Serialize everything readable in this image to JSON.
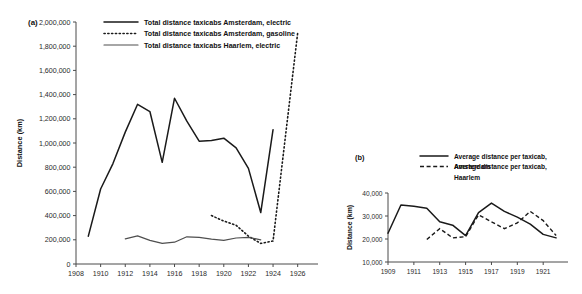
{
  "figure": {
    "background": "#ffffff",
    "ink": "#1a1a1a"
  },
  "panel_a": {
    "tag": "(a)",
    "ylabel": "Distance (km)",
    "legend": [
      {
        "label": "Total distance taxicabs Amsterdam, electric",
        "style": "solid"
      },
      {
        "label": "Total distance taxicabs Amsterdam, gasoline",
        "style": "dotted"
      },
      {
        "label": "Total distance taxicabs Haarlem, electric",
        "style": "thin-solid"
      }
    ],
    "ytick_labels": [
      "0",
      "200,000",
      "400,000",
      "600,000",
      "800,000",
      "1,000,000",
      "1,200,000",
      "1,400,000",
      "1,600,000",
      "1,800,000",
      "2,000,000"
    ],
    "xtick_labels": [
      "1908",
      "1910",
      "1912",
      "1914",
      "1916",
      "1918",
      "1920",
      "1922",
      "1924",
      "1926"
    ]
  },
  "panel_b": {
    "tag": "(b)",
    "ylabel": "Distance (km)",
    "legend": [
      {
        "label": "Average distance per taxicab, Amsterdam",
        "style": "solid"
      },
      {
        "label": "Average distance per taxicab, Haarlem",
        "style": "dashed"
      }
    ],
    "ytick_labels": [
      "10,000",
      "20,000",
      "30,000",
      "40,000"
    ],
    "xtick_labels": [
      "1909",
      "1911",
      "1913",
      "1915",
      "1917",
      "1919",
      "1921"
    ]
  },
  "chart_data": [
    {
      "type": "line",
      "panel": "(a)",
      "title": "",
      "xlabel": "",
      "ylabel": "Distance (km)",
      "xlim": [
        1908,
        1927
      ],
      "ylim": [
        0,
        2000000
      ],
      "xticks": [
        1908,
        1910,
        1912,
        1914,
        1916,
        1918,
        1920,
        1922,
        1924,
        1926
      ],
      "yticks": [
        0,
        200000,
        400000,
        600000,
        800000,
        1000000,
        1200000,
        1400000,
        1600000,
        1800000,
        2000000
      ],
      "grid": false,
      "legend_position": "top-center",
      "series": [
        {
          "name": "Total distance taxicabs Amsterdam, electric",
          "style": "solid",
          "x": [
            1909,
            1910,
            1911,
            1912,
            1913,
            1914,
            1915,
            1916,
            1917,
            1918,
            1919,
            1920,
            1921,
            1922,
            1923,
            1924
          ],
          "values": [
            230000,
            620000,
            830000,
            1090000,
            1320000,
            1260000,
            840000,
            1370000,
            1180000,
            1015000,
            1020000,
            1040000,
            960000,
            790000,
            425000,
            1110000
          ]
        },
        {
          "name": "Total distance taxicabs Amsterdam, gasoline",
          "style": "dotted",
          "x": [
            1919,
            1920,
            1921,
            1922,
            1923,
            1924,
            1926
          ],
          "values": [
            400000,
            355000,
            320000,
            230000,
            170000,
            190000,
            1910000
          ]
        },
        {
          "name": "Total distance taxicabs Haarlem, electric",
          "style": "thin-solid",
          "x": [
            1912,
            1913,
            1914,
            1915,
            1916,
            1917,
            1918,
            1919,
            1920,
            1921,
            1922,
            1923
          ],
          "values": [
            207000,
            232000,
            195000,
            170000,
            180000,
            225000,
            220000,
            205000,
            195000,
            215000,
            220000,
            200000
          ]
        }
      ]
    },
    {
      "type": "line",
      "panel": "(b)",
      "title": "",
      "xlabel": "",
      "ylabel": "Distance (km)",
      "xlim": [
        1909,
        1922.3
      ],
      "ylim": [
        10000,
        40000
      ],
      "xticks": [
        1909,
        1911,
        1913,
        1915,
        1917,
        1919,
        1921
      ],
      "yticks": [
        10000,
        20000,
        30000,
        40000
      ],
      "grid": false,
      "legend_position": "top-right",
      "series": [
        {
          "name": "Average distance per taxicab, Amsterdam",
          "style": "solid",
          "x": [
            1909,
            1910,
            1911,
            1912,
            1913,
            1914,
            1915,
            1916,
            1917,
            1918,
            1919,
            1920,
            1921,
            1922
          ],
          "values": [
            22500,
            34800,
            34200,
            33400,
            27500,
            26000,
            21500,
            31500,
            35600,
            32000,
            29500,
            26500,
            22000,
            20500
          ]
        },
        {
          "name": "Average distance per taxicab, Haarlem",
          "style": "dashed",
          "x": [
            1912,
            1913,
            1914,
            1915,
            1916,
            1917,
            1918,
            1919,
            1920,
            1921,
            1922
          ],
          "values": [
            19800,
            24500,
            20500,
            21000,
            30500,
            27500,
            24500,
            27000,
            32000,
            28000,
            21500
          ]
        }
      ]
    }
  ]
}
